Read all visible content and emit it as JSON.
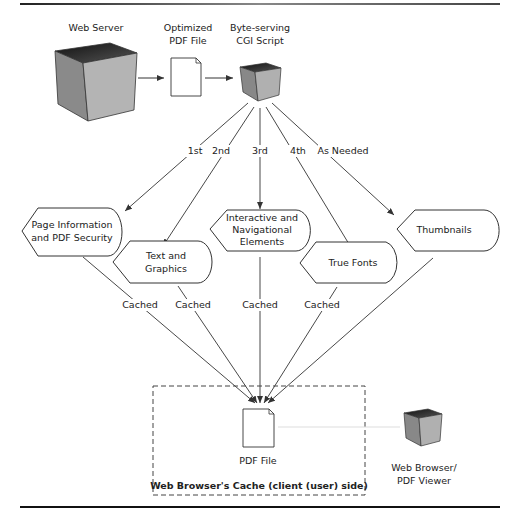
{
  "diagram": {
    "top_nodes": {
      "web_server": "Web Server",
      "optimized_pdf_line1": "Optimized",
      "optimized_pdf_line2": "PDF File",
      "cgi_line1": "Byte-serving",
      "cgi_line2": "CGI Script"
    },
    "order_labels": [
      "1st",
      "2nd",
      "3rd",
      "4th",
      "As Needed"
    ],
    "content_nodes": [
      {
        "line1": "Page Information",
        "line2": "and PDF Security"
      },
      {
        "line1": "Text and",
        "line2": "Graphics"
      },
      {
        "line1": "Interactive and",
        "line2": "Navigational",
        "line3": "Elements"
      },
      {
        "line1": "True Fonts"
      },
      {
        "line1": "Thumbnails"
      }
    ],
    "cached_label": "Cached",
    "cache_box": {
      "file_label": "PDF File",
      "title": "Web Browser's Cache (client (user) side)"
    },
    "viewer": {
      "line1": "Web Browser/",
      "line2": "PDF Viewer"
    }
  }
}
